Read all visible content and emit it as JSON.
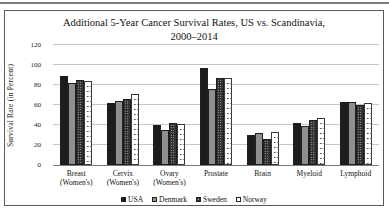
{
  "chart_data": {
    "type": "bar",
    "title": "Additional 5-Year Cancer Survival Rates, US vs. Scandinavia, 2000–2014",
    "title_line1": "Additional 5-Year Cancer Survival Rates, US vs. Scandinavia,",
    "title_line2": "2000–2014",
    "ylabel": "Survival Rate (in Percent)",
    "xlabel": "",
    "ylim": [
      0,
      120
    ],
    "yticks": [
      0,
      20,
      40,
      60,
      80,
      100,
      120
    ],
    "grid": true,
    "legend_position": "bottom",
    "categories": [
      "Breast\n(Women's)",
      "Cervix\n(Women's)",
      "Ovary\n(Women's)",
      "Prostate",
      "Brain",
      "Myeloid",
      "Lymphoid"
    ],
    "series": [
      {
        "name": "USA",
        "color": "#1c1c1c",
        "pattern": "solid",
        "values": [
          89,
          62,
          40,
          97,
          30,
          42,
          63
        ]
      },
      {
        "name": "Denmark",
        "color": "#8f8f8f",
        "pattern": "solid",
        "values": [
          82,
          64,
          35,
          76,
          32,
          39,
          63
        ]
      },
      {
        "name": "Sweden",
        "color": "#2f2f2f",
        "pattern": "checker",
        "values": [
          85,
          66,
          42,
          87,
          26,
          45,
          60
        ]
      },
      {
        "name": "Norway",
        "color": "#ffffff",
        "pattern": "dots",
        "values": [
          84,
          71,
          41,
          87,
          33,
          47,
          62
        ]
      }
    ]
  }
}
